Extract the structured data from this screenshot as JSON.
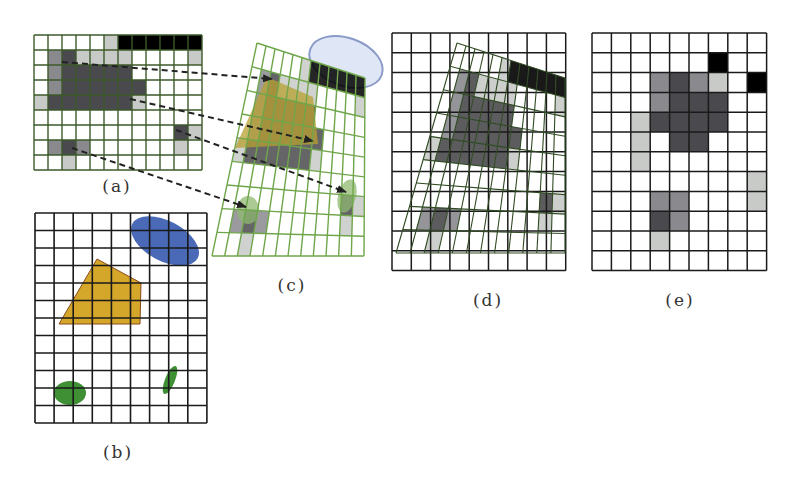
{
  "figure": {
    "labels": [
      {
        "id": "a",
        "text": "(a)",
        "x": 117,
        "y": 186
      },
      {
        "id": "b",
        "text": "(b)",
        "x": 118,
        "y": 452
      },
      {
        "id": "c",
        "text": "(c)",
        "x": 292,
        "y": 285
      },
      {
        "id": "d",
        "text": "(d)",
        "x": 488,
        "y": 300
      },
      {
        "id": "e",
        "text": "(e)",
        "x": 680,
        "y": 300
      }
    ],
    "colors": {
      "grid_black": "#1a1a1a",
      "grid_green_a": "#3d5a2a",
      "grid_green_c": "#6fa64a",
      "grid_green_d": "#2f4a22",
      "cell_black": "#000000",
      "cell_dark": "#4a4a4e",
      "cell_mid": "#8a8a8e",
      "cell_light": "#c8cac8",
      "yellow_shape": "#d4a62a",
      "yellow_stroke": "#8a4a1a",
      "blue_shape": "#4a6ab8",
      "green_shape": "#3f8f35",
      "arrow": "#222222"
    },
    "panel_a": {
      "x": 34,
      "y": 35,
      "cols": 12,
      "rows": 9,
      "cell_w": 14,
      "cell_h": 15,
      "cells": [
        [
          0,
          5,
          "light"
        ],
        [
          0,
          6,
          "black"
        ],
        [
          0,
          7,
          "black"
        ],
        [
          0,
          8,
          "black"
        ],
        [
          0,
          9,
          "black"
        ],
        [
          0,
          10,
          "black"
        ],
        [
          0,
          11,
          "black"
        ],
        [
          1,
          1,
          "mid"
        ],
        [
          1,
          2,
          "dark"
        ],
        [
          1,
          3,
          "light"
        ],
        [
          1,
          4,
          "light"
        ],
        [
          1,
          5,
          "light"
        ],
        [
          1,
          6,
          "light"
        ],
        [
          1,
          11,
          "light"
        ],
        [
          2,
          1,
          "mid"
        ],
        [
          2,
          2,
          "dark"
        ],
        [
          2,
          3,
          "dark"
        ],
        [
          2,
          4,
          "dark"
        ],
        [
          2,
          5,
          "dark"
        ],
        [
          2,
          6,
          "dark"
        ],
        [
          3,
          1,
          "mid"
        ],
        [
          3,
          2,
          "dark"
        ],
        [
          3,
          3,
          "dark"
        ],
        [
          3,
          4,
          "dark"
        ],
        [
          3,
          5,
          "dark"
        ],
        [
          3,
          6,
          "dark"
        ],
        [
          3,
          7,
          "dark"
        ],
        [
          4,
          0,
          "light"
        ],
        [
          4,
          1,
          "dark"
        ],
        [
          4,
          2,
          "dark"
        ],
        [
          4,
          3,
          "dark"
        ],
        [
          4,
          4,
          "dark"
        ],
        [
          4,
          5,
          "dark"
        ],
        [
          4,
          6,
          "dark"
        ],
        [
          4,
          7,
          "light"
        ],
        [
          6,
          10,
          "dark"
        ],
        [
          6,
          11,
          "light"
        ],
        [
          7,
          1,
          "mid"
        ],
        [
          7,
          2,
          "dark"
        ],
        [
          7,
          3,
          "mid"
        ],
        [
          7,
          10,
          "light"
        ],
        [
          8,
          2,
          "light"
        ]
      ]
    },
    "panel_b": {
      "x": 35,
      "y": 213,
      "cols": 9,
      "rows": 12,
      "cell_w": 19.1,
      "cell_h": 17.5,
      "yellow_polygon": [
        [
          97,
          259
        ],
        [
          141,
          283
        ],
        [
          140,
          324
        ],
        [
          59,
          324
        ]
      ],
      "blue_blob": {
        "cx": 165,
        "cy": 241,
        "rx": 37,
        "ry": 20,
        "rotate": 28
      },
      "green_ellipses": [
        {
          "cx": 70,
          "cy": 393,
          "rx": 16,
          "ry": 12,
          "rotate": 0
        },
        {
          "cx": 170,
          "cy": 380,
          "rx": 5,
          "ry": 15,
          "rotate": 22
        }
      ]
    },
    "panel_c": {
      "corners": {
        "tl": [
          257,
          43
        ],
        "tr": [
          365,
          78
        ],
        "br": [
          364,
          256
        ],
        "bl": [
          212,
          256
        ]
      },
      "cols": 12,
      "rows": 9,
      "ellipse_outline": {
        "cx": 346,
        "cy": 62,
        "rx": 38,
        "ry": 24,
        "rotate": 20,
        "fill": "#dfe6f5",
        "stroke": "#8a9ac8"
      },
      "yellow_polygon": [
        [
          267,
          77
        ],
        [
          313,
          97
        ],
        [
          318,
          144
        ],
        [
          235,
          148
        ]
      ],
      "green_ellipses": [
        {
          "cx": 347,
          "cy": 196,
          "rx": 9,
          "ry": 17,
          "rotate": 15
        },
        {
          "cx": 248,
          "cy": 210,
          "rx": 11,
          "ry": 14,
          "rotate": 0
        }
      ]
    },
    "panel_d": {
      "x": 392,
      "y": 33,
      "cols": 9,
      "rows": 12,
      "cell_w": 19.3,
      "cell_h": 19.8,
      "overlay_corners": {
        "tl": [
          457,
          43
        ],
        "tr": [
          565,
          78
        ],
        "br": [
          565,
          253
        ],
        "bl": [
          396,
          253
        ]
      },
      "overlay_cols": 12,
      "overlay_rows": 9
    },
    "panel_e": {
      "x": 592,
      "y": 33,
      "cols": 9,
      "rows": 12,
      "cell_w": 19.4,
      "cell_h": 19.8,
      "cells": [
        [
          1,
          6,
          "black"
        ],
        [
          2,
          3,
          "mid"
        ],
        [
          2,
          4,
          "dark"
        ],
        [
          2,
          5,
          "mid"
        ],
        [
          2,
          6,
          "light"
        ],
        [
          2,
          8,
          "black"
        ],
        [
          3,
          3,
          "mid"
        ],
        [
          3,
          4,
          "dark"
        ],
        [
          3,
          5,
          "dark"
        ],
        [
          3,
          6,
          "dark"
        ],
        [
          4,
          2,
          "light"
        ],
        [
          4,
          3,
          "dark"
        ],
        [
          4,
          4,
          "dark"
        ],
        [
          4,
          5,
          "dark"
        ],
        [
          4,
          6,
          "dark"
        ],
        [
          5,
          2,
          "light"
        ],
        [
          5,
          4,
          "dark"
        ],
        [
          5,
          5,
          "dark"
        ],
        [
          6,
          2,
          "light"
        ],
        [
          7,
          8,
          "light"
        ],
        [
          8,
          3,
          "mid"
        ],
        [
          8,
          4,
          "mid"
        ],
        [
          8,
          8,
          "light"
        ],
        [
          9,
          3,
          "dark"
        ],
        [
          9,
          4,
          "mid"
        ],
        [
          10,
          3,
          "light"
        ]
      ]
    },
    "arrows": [
      {
        "from": [
          62,
          62
        ],
        "to": [
          272,
          79
        ]
      },
      {
        "from": [
          130,
          99
        ],
        "to": [
          313,
          141
        ]
      },
      {
        "from": [
          176,
          130
        ],
        "to": [
          346,
          192
        ]
      },
      {
        "from": [
          72,
          148
        ],
        "to": [
          246,
          207
        ]
      }
    ]
  }
}
